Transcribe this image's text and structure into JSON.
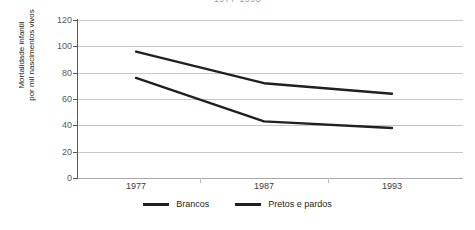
{
  "chart": {
    "title": "1977-1993",
    "y_axis_title_line1": "Mortalidade infantil",
    "y_axis_title_line2": "por mil nascimentos vivos",
    "y_ticks": [
      "120",
      "100",
      "80",
      "60",
      "40",
      "20",
      "0"
    ],
    "x_ticks": [
      "1977",
      "1987",
      "1993"
    ],
    "legend": [
      {
        "label": "Brancos",
        "color": "#231f20"
      },
      {
        "label": "Pretos e pardos",
        "color": "#231f20"
      }
    ]
  },
  "chart_data": {
    "type": "line",
    "title": "1977-1993",
    "xlabel": "",
    "ylabel": "Mortalidade infantil por mil nascimentos vivos",
    "categories": [
      "1977",
      "1987",
      "1993"
    ],
    "x": [
      1977,
      1987,
      1993
    ],
    "series": [
      {
        "name": "Brancos",
        "values": [
          76,
          43,
          38
        ],
        "color": "#231f20"
      },
      {
        "name": "Pretos e pardos",
        "values": [
          96,
          72,
          64
        ],
        "color": "#231f20"
      }
    ],
    "ylim": [
      0,
      120
    ],
    "yticks": [
      0,
      20,
      40,
      60,
      80,
      100,
      120
    ],
    "grid": true,
    "legend_position": "bottom"
  }
}
